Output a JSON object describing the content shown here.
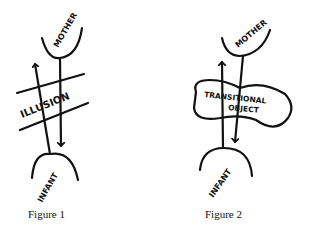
{
  "figures": [
    {
      "caption": "Figure 1",
      "labels": {
        "top": "MOTHER",
        "middle": "ILLUSION",
        "bottom": "INFANT"
      }
    },
    {
      "caption": "Figure 2",
      "labels": {
        "top": "MOTHER",
        "middle_line1": "TRANSITIONAL",
        "middle_line2": "OBJECT",
        "bottom": "INFANT"
      }
    }
  ],
  "colors": {
    "ink": "#111111",
    "background": "#ffffff"
  }
}
